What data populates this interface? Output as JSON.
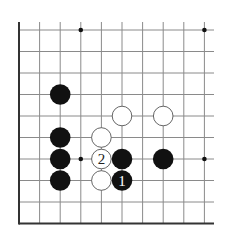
{
  "diagram": {
    "type": "go-board-corner",
    "columns": 10,
    "rows": 10,
    "edges": [
      "left",
      "bottom"
    ],
    "colors": {
      "background": "#ffffff",
      "grid": "#8a8a8a",
      "edge": "#333333",
      "black_stone": "#111111",
      "white_stone_fill": "#ffffff",
      "white_stone_stroke": "#555555",
      "label_on_black": "#ffffff",
      "label_on_white": "#222222"
    },
    "star_points": [
      {
        "col": 3,
        "row": 0
      },
      {
        "col": 9,
        "row": 0
      },
      {
        "col": 3,
        "row": 6
      },
      {
        "col": 9,
        "row": 6
      }
    ],
    "stones": [
      {
        "color": "black",
        "col": 2,
        "row": 3,
        "label": ""
      },
      {
        "color": "black",
        "col": 2,
        "row": 5,
        "label": ""
      },
      {
        "color": "black",
        "col": 2,
        "row": 6,
        "label": ""
      },
      {
        "color": "black",
        "col": 2,
        "row": 7,
        "label": ""
      },
      {
        "color": "black",
        "col": 5,
        "row": 6,
        "label": ""
      },
      {
        "color": "black",
        "col": 5,
        "row": 7,
        "label": "1"
      },
      {
        "color": "black",
        "col": 7,
        "row": 6,
        "label": ""
      },
      {
        "color": "white",
        "col": 5,
        "row": 4,
        "label": ""
      },
      {
        "color": "white",
        "col": 7,
        "row": 4,
        "label": ""
      },
      {
        "color": "white",
        "col": 4,
        "row": 5,
        "label": ""
      },
      {
        "color": "white",
        "col": 4,
        "row": 6,
        "label": "2"
      },
      {
        "color": "white",
        "col": 4,
        "row": 7,
        "label": ""
      }
    ],
    "move_labels": {
      "move_1": "1",
      "move_2": "2"
    }
  }
}
